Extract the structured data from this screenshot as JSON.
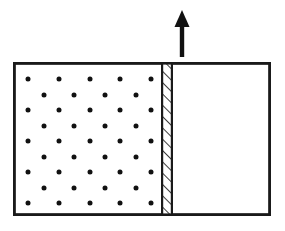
{
  "canvas": {
    "width": 285,
    "height": 231,
    "background_color": "#ffffff"
  },
  "diagram": {
    "stroke_color": "#1a1a1a",
    "fill_color": "#ffffff",
    "dot_color": "#111111"
  },
  "container": {
    "label": "container-outline",
    "x": 13,
    "y": 62,
    "width": 258,
    "height": 154,
    "border_width": 2.6,
    "border_color": "#1a1a1a",
    "fill": "#ffffff"
  },
  "gas_region": {
    "label": "gas-filled-left-chamber",
    "x": 15,
    "y": 64,
    "width": 146,
    "height": 150,
    "fill": "#ffffff"
  },
  "vacuum_region": {
    "label": "empty-right-chamber",
    "x": 173,
    "y": 64,
    "width": 96,
    "height": 150,
    "fill": "#ffffff"
  },
  "piston": {
    "label": "hatched-piston",
    "x": 161,
    "y": 62,
    "width": 12,
    "height": 154,
    "edge_width": 2.2,
    "hatch_color": "#1a1a1a",
    "hatch_width": 1.6,
    "hatch_count": 19,
    "hatch_direction": "lower-left-to-upper-right"
  },
  "arrow": {
    "label": "upward-force-arrow",
    "direction": "up",
    "color": "#111111",
    "tip_x": 182,
    "tip_y": 10,
    "tail_y": 57,
    "head_width": 15,
    "head_height": 17,
    "shaft_width": 4.4
  },
  "particles": {
    "label": "gas-molecule-dots",
    "dot_radius": 2.5,
    "color": "#111111",
    "row_count": 9,
    "total_count": 41,
    "rows": [
      {
        "y": 79,
        "count": 5,
        "xs": [
          28,
          59,
          90,
          120,
          151
        ]
      },
      {
        "y": 95,
        "count": 4,
        "xs": [
          44,
          74,
          105,
          136
        ]
      },
      {
        "y": 110,
        "count": 5,
        "xs": [
          28,
          59,
          90,
          120,
          151
        ]
      },
      {
        "y": 126,
        "count": 4,
        "xs": [
          44,
          74,
          105,
          136
        ]
      },
      {
        "y": 141,
        "count": 5,
        "xs": [
          28,
          59,
          90,
          120,
          151
        ]
      },
      {
        "y": 157,
        "count": 4,
        "xs": [
          44,
          74,
          105,
          136
        ]
      },
      {
        "y": 172,
        "count": 5,
        "xs": [
          28,
          59,
          90,
          120,
          151
        ]
      },
      {
        "y": 188,
        "count": 4,
        "xs": [
          44,
          74,
          105,
          136
        ]
      },
      {
        "y": 203,
        "count": 5,
        "xs": [
          28,
          59,
          90,
          120,
          151
        ]
      }
    ]
  }
}
